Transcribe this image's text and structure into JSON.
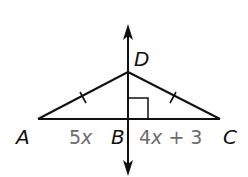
{
  "diagram": {
    "type": "geometry-figure",
    "points": {
      "A": {
        "label": "A",
        "x": 38,
        "y": 119
      },
      "B": {
        "label": "B",
        "x": 128,
        "y": 119
      },
      "C": {
        "label": "C",
        "x": 220,
        "y": 119
      },
      "D": {
        "label": "D",
        "x": 128,
        "y": 72
      }
    },
    "segments": [
      "AD",
      "DC",
      "AC"
    ],
    "congruent_marks": [
      "AD",
      "DC"
    ],
    "right_angle_at": "B",
    "line": {
      "through": [
        "D",
        "B"
      ],
      "arrows": "both"
    },
    "measures": {
      "AB": {
        "coef": "5",
        "var": "x"
      },
      "BC": {
        "coef": "4",
        "var": "x",
        "rest": " + 3"
      }
    },
    "colors": {
      "lines": "#111111",
      "measures": "#6b6b6b",
      "background": "#ffffff"
    }
  }
}
